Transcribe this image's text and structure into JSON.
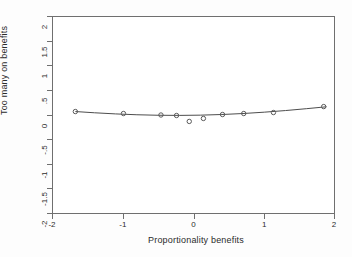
{
  "chart_data": {
    "type": "scatter",
    "title": "",
    "xlabel": "Proportionality benefits",
    "ylabel": "Too many on benefits",
    "xlim": [
      -2,
      2
    ],
    "ylim": [
      -2,
      2
    ],
    "xticks": [
      -2,
      -1,
      0,
      1,
      2
    ],
    "xtick_labels": [
      "-2",
      "-1",
      "0",
      "1",
      "2"
    ],
    "yticks": [
      2,
      1.5,
      1,
      0.5,
      0,
      -0.5,
      -1,
      -1.5,
      -2
    ],
    "ytick_labels": [
      "2",
      "1.5",
      "1",
      ".5",
      "0",
      "-.5",
      "-1",
      "-1.5",
      "-2"
    ],
    "grid": false,
    "legend": false,
    "marker": "open-circle",
    "marker_color": "#5a5a5a",
    "line_color": "#4d4d4d",
    "series": [
      {
        "name": "binned means",
        "type": "scatter",
        "x": [
          -1.67,
          -0.99,
          -0.46,
          -0.24,
          -0.06,
          0.14,
          0.41,
          0.71,
          1.13,
          1.84
        ],
        "y": [
          0.07,
          0.03,
          0.0,
          -0.01,
          -0.13,
          -0.07,
          0.01,
          0.03,
          0.05,
          0.17
        ]
      },
      {
        "name": "quadratic fit",
        "type": "line",
        "x": [
          -1.67,
          -1.4,
          -1.1,
          -0.8,
          -0.5,
          -0.2,
          0.1,
          0.4,
          0.7,
          1.0,
          1.3,
          1.6,
          1.88
        ],
        "y": [
          0.07,
          0.045,
          0.022,
          0.005,
          -0.005,
          -0.008,
          -0.003,
          0.01,
          0.03,
          0.057,
          0.09,
          0.128,
          0.166
        ]
      }
    ]
  },
  "axes": {
    "y_title": "Too many on benefits",
    "x_title": "Proportionality benefits"
  }
}
